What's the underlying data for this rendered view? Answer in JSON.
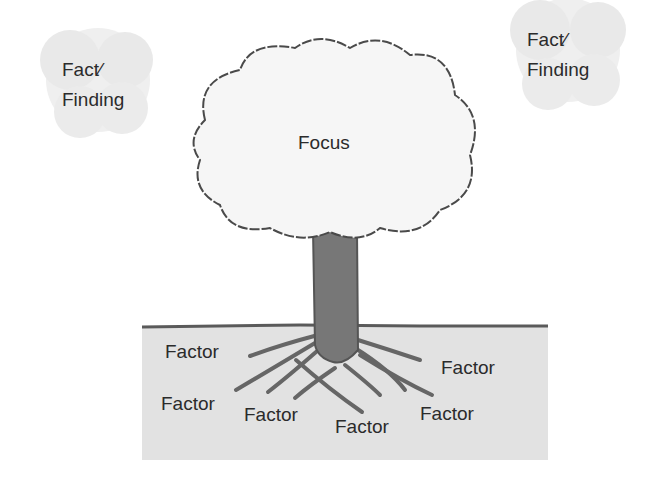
{
  "diagram": {
    "type": "root-cause-tree",
    "colors": {
      "background": "#ffffff",
      "ground": "#e2e2e2",
      "ground_line": "#5a5a5a",
      "trunk": "#777777",
      "cloud_fill": "#f6f6f6",
      "cloud_outline": "#4a4a4a",
      "fact_blob": "#ececec",
      "text": "#2b2b2b"
    },
    "canopy": {
      "label": "Focus"
    },
    "facts": [
      {
        "line1": "Fact∕",
        "line2": "Finding"
      },
      {
        "line1": "Fact∕",
        "line2": "Finding"
      }
    ],
    "factors": [
      {
        "label": "Factor"
      },
      {
        "label": "Factor"
      },
      {
        "label": "Factor"
      },
      {
        "label": "Factor"
      },
      {
        "label": "Factor"
      },
      {
        "label": "Factor"
      }
    ]
  }
}
